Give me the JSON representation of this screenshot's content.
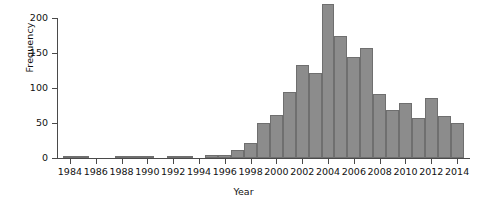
{
  "chart_data": {
    "type": "bar",
    "title": "",
    "xlabel": "Year",
    "ylabel": "Frequency",
    "xlim": [
      1983,
      2015
    ],
    "ylim": [
      0,
      220
    ],
    "grid": false,
    "legend": null,
    "bar_color": "#8c8c8c",
    "bar_edge_color": "#6f6f6f",
    "axis_color": "#4a4a4a",
    "text_color": "#111111",
    "x_tick_labels": [
      "1984",
      "1986",
      "1988",
      "1990",
      "1992",
      "1994",
      "1996",
      "1998",
      "2000",
      "2002",
      "2004",
      "2006",
      "2008",
      "2010",
      "2012",
      "2014"
    ],
    "x_tick_values": [
      1984,
      1986,
      1988,
      1990,
      1992,
      1994,
      1996,
      1998,
      2000,
      2002,
      2004,
      2006,
      2008,
      2010,
      2012,
      2014
    ],
    "y_tick_labels": [
      "0",
      "50",
      "100",
      "150",
      "200"
    ],
    "y_tick_values": [
      0,
      50,
      100,
      150,
      200
    ],
    "categories": [
      1984,
      1985,
      1986,
      1987,
      1988,
      1989,
      1990,
      1991,
      1992,
      1993,
      1994,
      1995,
      1996,
      1997,
      1998,
      1999,
      2000,
      2001,
      2002,
      2003,
      2004,
      2005,
      2006,
      2007,
      2008,
      2009,
      2010,
      2011,
      2012,
      2013,
      2014
    ],
    "values": [
      2,
      2,
      0,
      0,
      3,
      3,
      3,
      0,
      3,
      3,
      0,
      4,
      4,
      12,
      22,
      50,
      62,
      95,
      133,
      122,
      220,
      174,
      145,
      157,
      91,
      68,
      78,
      57,
      86,
      60,
      50
    ]
  }
}
